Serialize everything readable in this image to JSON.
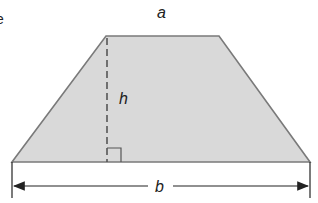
{
  "diagram": {
    "shape": "trapezoid",
    "fill_color": "#d9d9d9",
    "stroke_color": "#7a7a7a",
    "labels": {
      "top_base": "a",
      "height": "h",
      "bottom_base": "b"
    },
    "edge_fragment": "e"
  }
}
